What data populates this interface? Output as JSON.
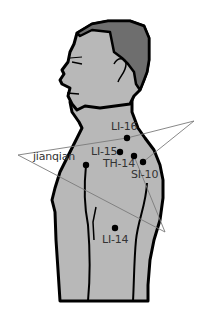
{
  "figure": {
    "colors": {
      "skin": "#b8b8b8",
      "hair": "#6e6e6e",
      "outline": "#000000",
      "leader_line": "#7a7a7a",
      "label_text": "#333333",
      "point": "#000000"
    }
  },
  "points": [
    {
      "id": "LI-16",
      "label": "LI-16",
      "x": 127,
      "y": 138
    },
    {
      "id": "LI-15",
      "label": "LI-15",
      "x": 120,
      "y": 152
    },
    {
      "id": "TH-14",
      "label": "TH-14",
      "x": 134,
      "y": 156
    },
    {
      "id": "SI-10",
      "label": "SI-10",
      "x": 143,
      "y": 162
    },
    {
      "id": "jianqian",
      "label": "jianqian",
      "x": 86,
      "y": 165
    },
    {
      "id": "LI-14",
      "label": "LI-14",
      "x": 115,
      "y": 228
    }
  ],
  "labels": {
    "li16": "LI-16",
    "li15": "LI-15",
    "th14": "TH-14",
    "si10": "SI-10",
    "jianqian": "jianqian",
    "li14": "LI-14"
  }
}
